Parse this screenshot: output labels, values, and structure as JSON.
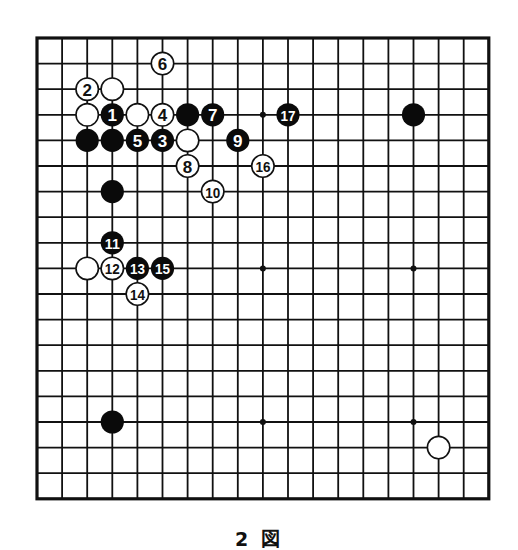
{
  "diagram": {
    "type": "go-board",
    "size": 19,
    "caption": "2 図",
    "colors": {
      "background": "#ffffff",
      "line": "#111111",
      "black_stone": "#0a0a0a",
      "white_stone": "#ffffff",
      "black_label": "#ffffff",
      "white_label": "#111111"
    },
    "star_points": [
      [
        3,
        3
      ],
      [
        9,
        3
      ],
      [
        15,
        3
      ],
      [
        3,
        9
      ],
      [
        9,
        9
      ],
      [
        15,
        9
      ],
      [
        3,
        15
      ],
      [
        9,
        15
      ],
      [
        15,
        15
      ]
    ],
    "stones": [
      {
        "col": 2,
        "row": 3,
        "color": "white",
        "label": ""
      },
      {
        "col": 3,
        "row": 2,
        "color": "white",
        "label": ""
      },
      {
        "col": 4,
        "row": 3,
        "color": "white",
        "label": ""
      },
      {
        "col": 6,
        "row": 4,
        "color": "white",
        "label": ""
      },
      {
        "col": 2,
        "row": 4,
        "color": "black",
        "label": ""
      },
      {
        "col": 3,
        "row": 4,
        "color": "black",
        "label": ""
      },
      {
        "col": 6,
        "row": 3,
        "color": "black",
        "label": ""
      },
      {
        "col": 3,
        "row": 6,
        "color": "black",
        "label": ""
      },
      {
        "col": 15,
        "row": 3,
        "color": "black",
        "label": ""
      },
      {
        "col": 3,
        "row": 15,
        "color": "black",
        "label": ""
      },
      {
        "col": 16,
        "row": 16,
        "color": "white",
        "label": ""
      },
      {
        "col": 2,
        "row": 9,
        "color": "white",
        "label": ""
      },
      {
        "col": 3,
        "row": 3,
        "color": "black",
        "label": "1"
      },
      {
        "col": 2,
        "row": 2,
        "color": "white",
        "label": "2"
      },
      {
        "col": 5,
        "row": 4,
        "color": "black",
        "label": "3"
      },
      {
        "col": 5,
        "row": 3,
        "color": "white",
        "label": "4"
      },
      {
        "col": 4,
        "row": 4,
        "color": "black",
        "label": "5"
      },
      {
        "col": 5,
        "row": 1,
        "color": "white",
        "label": "6"
      },
      {
        "col": 7,
        "row": 3,
        "color": "black",
        "label": "7"
      },
      {
        "col": 6,
        "row": 5,
        "color": "white",
        "label": "8"
      },
      {
        "col": 8,
        "row": 4,
        "color": "black",
        "label": "9"
      },
      {
        "col": 7,
        "row": 6,
        "color": "white",
        "label": "10"
      },
      {
        "col": 3,
        "row": 8,
        "color": "black",
        "label": "11"
      },
      {
        "col": 3,
        "row": 9,
        "color": "white",
        "label": "12"
      },
      {
        "col": 4,
        "row": 9,
        "color": "black",
        "label": "13"
      },
      {
        "col": 4,
        "row": 10,
        "color": "white",
        "label": "14"
      },
      {
        "col": 5,
        "row": 9,
        "color": "black",
        "label": "15"
      },
      {
        "col": 9,
        "row": 5,
        "color": "white",
        "label": "16"
      },
      {
        "col": 10,
        "row": 3,
        "color": "black",
        "label": "17"
      }
    ]
  }
}
